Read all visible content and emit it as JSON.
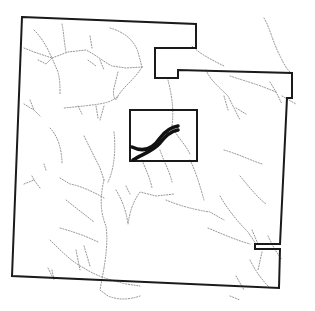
{
  "map": {
    "type": "parcel boundary map with drainage network",
    "colors": {
      "background": "#ffffff",
      "boundary": "#1a1a1a",
      "thick_feature": "#111111",
      "streams": "#8a8a8a"
    },
    "boundary_points": "22,17 196,24 196,48 155,48 155,78 178,78 178,70 292,73 292,98 287,98 280,244 255,244 255,249 280,249 279,288 12,276",
    "inner_rectangle": {
      "x": 130,
      "y": 110,
      "width": 67,
      "height": 51
    },
    "thick_lines": [
      "M132,147 C142,152 152,150 160,138 C166,130 172,127 178,126",
      "M133,160 C142,154 152,152 160,143 C166,135 172,131 178,130"
    ],
    "streams": [
      "M34,30 C44,40 48,50 52,58 L68,52 L86,50 C96,55 104,62 112,66 L126,68 L142,67",
      "M62,24 C64,34 64,42 66,52",
      "M24,48 L34,52 L52,58",
      "M38,60 L46,64 L52,58 L58,72 C60,80 60,86 60,94",
      "M90,36 L92,48 M88,60 L96,66 M100,60 L104,70",
      "M110,28 C124,32 134,40 138,52 L142,67",
      "M142,67 C134,80 124,86 118,96 C110,104 98,104 84,106 L64,108",
      "M118,72 L114,88 C112,96 116,104 118,96",
      "M96,106 L98,118 M104,106 L100,120 M78,106 L82,114",
      "M24,104 L34,110 L40,116 M30,100 L34,110",
      "M50,128 C58,136 62,150 62,164 M46,170 L44,164",
      "M84,136 C90,148 96,160 100,168 L104,180",
      "M114,132 C116,150 114,170 108,182",
      "M104,180 C100,196 100,212 106,226 C108,240 106,256 104,268",
      "M60,178 L70,184 C80,186 90,190 104,198",
      "M24,184 L34,180 L40,188 M32,176 L34,180",
      "M66,200 C76,208 84,214 94,222",
      "M60,228 C74,232 86,236 98,242",
      "M50,240 C62,252 72,262 84,268",
      "M76,250 L80,270 M84,246 L90,266",
      "M116,190 C122,200 126,210 128,224 C130,210 134,200 140,192 L156,196 L174,194",
      "M126,186 L130,194",
      "M84,268 C96,276 110,280 126,284 L140,286",
      "M104,268 L100,290 L108,296 C118,300 128,300 140,296",
      "M52,270 L54,280 M48,268 L52,276",
      "M142,160 C146,170 150,178 152,188",
      "M160,150 C164,162 170,172 172,182",
      "M192,46 C200,54 212,60 224,66",
      "M206,70 C210,80 220,88 228,96 C232,104 236,112 240,120",
      "M224,96 L228,110 M236,108 L246,114",
      "M230,76 C242,80 256,84 266,88 L276,92",
      "M264,18 C270,28 272,40 280,56 C284,64 286,68 290,72",
      "M270,82 L276,92 L282,104 M282,96 L296,104",
      "M168,80 C172,96 174,110 172,126 C176,136 184,142 190,154",
      "M190,160 C196,172 200,186 204,200",
      "M166,200 C180,206 196,210 210,212 L224,220",
      "M240,176 C250,188 258,198 266,204",
      "M224,150 C238,154 250,160 262,164",
      "M220,196 C228,210 238,222 248,232 L256,244",
      "M208,228 C222,234 236,240 250,244",
      "M252,230 L258,244 M262,252 L258,270",
      "M250,260 C256,272 262,280 270,288",
      "M268,236 L274,248 L282,260",
      "M236,276 L244,290 M230,296 L240,300"
    ]
  }
}
